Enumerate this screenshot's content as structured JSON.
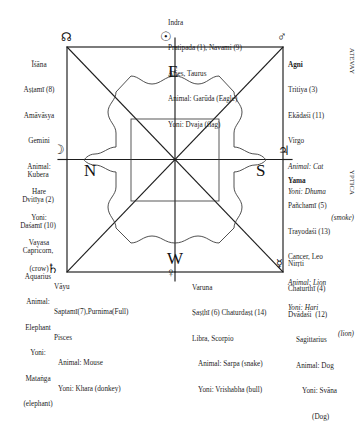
{
  "diagram": {
    "directions": [
      {
        "key": "E",
        "label": "E"
      },
      {
        "key": "N",
        "label": "N"
      },
      {
        "key": "S",
        "label": "S"
      },
      {
        "key": "W",
        "label": "W"
      }
    ],
    "colors": {
      "line": "#1d1d1d",
      "text": "#1d1d1d",
      "background": "#ffffff"
    }
  },
  "symbols": {
    "sun": "☉",
    "rahu": "☊",
    "mars": "♂",
    "moon": "☽",
    "jupiter": "♃",
    "saturn": "♄",
    "venus": "♀",
    "mercury": "☿"
  },
  "blocks": {
    "indra": {
      "deity": "Indra",
      "tithis": "Pratipada (1), Navami (9)",
      "signs": "Aries, Taurus",
      "animal": "Animal: Garūda (Eagle)",
      "yoni": "Yoni: Dvaja (flag)"
    },
    "isana": {
      "deity": "Īśāna",
      "tithis": "Aṣṭamī (8)",
      "tithis2": "Amāvāsya",
      "signs": "Gemini",
      "animal": "Animal:",
      "animal2": "Hare",
      "yoni": "Yoni:",
      "yoni2": "Vayasa",
      "yoni3": "(crow)"
    },
    "agni": {
      "deity": "Agni",
      "tithis": "Tritiya (3)",
      "tithis2": "Ekādaśi (11)",
      "signs": "Virgo",
      "animal": "Animal: Cat",
      "yoni": "Yoni: Dhuma",
      "yoni2": "(smoke)"
    },
    "kubera": {
      "deity": "Kubera",
      "tithis": "Dvitīya (2)",
      "tithis2": "Daśamī (10)",
      "signs": "Capricorn,",
      "signs2": "Aquarius",
      "animal": "Animal:",
      "animal2": "Elephant",
      "yoni": "Yoni:",
      "yoni2": "Mataṅga",
      "yoni3": "(elephant)"
    },
    "yama": {
      "deity": "Yama",
      "tithis": "Pañchamī (5)",
      "tithis2": "Trayodaśi (13)",
      "signs": "Cancer, Leo",
      "animal": "Animal: Lion",
      "yoni": "Yoni: Hari",
      "yoni2": "(lion)"
    },
    "nirrti": {
      "deity": "Nirṛti",
      "tithis": "Chaturthī (4)",
      "tithis2": "Dvādaśi  (12)",
      "signs": "Sagittarius",
      "animal": "Animal: Dog",
      "yoni": "Yoni: Svāna",
      "yoni2": "(Dog)"
    },
    "varuna": {
      "deity": "Varuna",
      "tithis": "Ṣaṣṭhī (6) Chaturdaṣṭ (14)",
      "signs": "Libra, Scorpio",
      "animal": "Animal: Sarpa (snake)",
      "yoni": "Yoni: Vrishabha (bull)"
    },
    "vayu": {
      "deity": "Vāyu",
      "tithis": "Saptamī(7),Purnima(Full)",
      "signs": "Pisces",
      "animal": "Animal: Mouse",
      "yoni": "Yoni: Khara (donkey)"
    }
  },
  "edge_text": {
    "right_top": "ATEVAY",
    "right_mid": "YPTICA"
  }
}
